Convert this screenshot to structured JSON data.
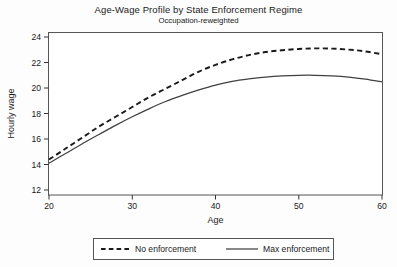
{
  "chart_data": {
    "type": "line",
    "title": "Age-Wage Profile by State Enforcement Regime",
    "subtitle": "Occupation-reweighted",
    "xlabel": "Age",
    "ylabel": "Hourly wage",
    "xlim": [
      20,
      60
    ],
    "ylim": [
      11.3,
      24.6
    ],
    "xticks": [
      20,
      30,
      40,
      50,
      60
    ],
    "yticks": [
      12,
      14,
      16,
      18,
      20,
      22,
      24
    ],
    "xtick_labels": [
      "20",
      "30",
      "40",
      "50",
      "60"
    ],
    "ytick_labels": [
      "12",
      "14",
      "16",
      "18",
      "20",
      "22",
      "24"
    ],
    "grid": false,
    "legend_position": "below-axes",
    "x": [
      20,
      22,
      24,
      26,
      28,
      30,
      32,
      34,
      36,
      38,
      40,
      42,
      44,
      46,
      48,
      50,
      52,
      54,
      56,
      58,
      60
    ],
    "series": [
      {
        "name": "No enforcement",
        "style": "dashed",
        "color": "#1a1a1a",
        "values": [
          14.2,
          15.1,
          16.0,
          16.9,
          17.7,
          18.5,
          19.3,
          20.0,
          20.7,
          21.4,
          21.95,
          22.4,
          22.75,
          23.0,
          23.15,
          23.25,
          23.3,
          23.28,
          23.2,
          23.05,
          22.82
        ]
      },
      {
        "name": "Max enforcement",
        "style": "solid",
        "color": "#404040",
        "values": [
          13.9,
          14.7,
          15.5,
          16.25,
          17.0,
          17.7,
          18.35,
          18.95,
          19.45,
          19.9,
          20.3,
          20.6,
          20.8,
          20.95,
          21.05,
          21.1,
          21.1,
          21.05,
          20.95,
          20.78,
          20.55
        ]
      }
    ]
  },
  "legend": {
    "items": [
      {
        "label": "No enforcement",
        "style": "dashed"
      },
      {
        "label": "Max enforcement",
        "style": "solid"
      }
    ]
  }
}
